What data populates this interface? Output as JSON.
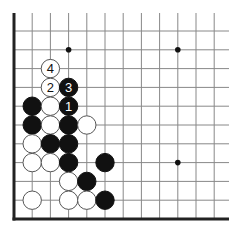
{
  "diagram": {
    "type": "go-board-corner",
    "grid": {
      "columns": 12,
      "rows": 11,
      "origin_x": 14,
      "origin_y": 31,
      "spacing_x": 18.2,
      "spacing_y": 18.8,
      "top_extent_y": 13,
      "right_extent_x": 229,
      "edges": [
        "left",
        "bottom"
      ]
    },
    "colors": {
      "line": "#888888",
      "edge": "#222222",
      "black_stone": "#111111",
      "white_stone": "#ffffff",
      "white_outline": "#555555"
    },
    "star_points": [
      {
        "col": 3,
        "row": 1
      },
      {
        "col": 9,
        "row": 1
      },
      {
        "col": 9,
        "row": 7
      }
    ],
    "stones": [
      {
        "col": 2,
        "row": 2,
        "color": "white",
        "label": "4"
      },
      {
        "col": 2,
        "row": 3,
        "color": "white",
        "label": "2"
      },
      {
        "col": 3,
        "row": 3,
        "color": "black",
        "label": "3"
      },
      {
        "col": 1,
        "row": 4,
        "color": "black",
        "label": ""
      },
      {
        "col": 2,
        "row": 4,
        "color": "white",
        "label": ""
      },
      {
        "col": 3,
        "row": 4,
        "color": "black",
        "label": "1"
      },
      {
        "col": 1,
        "row": 5,
        "color": "black",
        "label": ""
      },
      {
        "col": 2,
        "row": 5,
        "color": "white",
        "label": ""
      },
      {
        "col": 3,
        "row": 5,
        "color": "black",
        "label": ""
      },
      {
        "col": 4,
        "row": 5,
        "color": "white",
        "label": ""
      },
      {
        "col": 1,
        "row": 6,
        "color": "white",
        "label": ""
      },
      {
        "col": 2,
        "row": 6,
        "color": "black",
        "label": ""
      },
      {
        "col": 3,
        "row": 6,
        "color": "black",
        "label": ""
      },
      {
        "col": 1,
        "row": 7,
        "color": "white",
        "label": ""
      },
      {
        "col": 2,
        "row": 7,
        "color": "white",
        "label": ""
      },
      {
        "col": 3,
        "row": 7,
        "color": "black",
        "label": ""
      },
      {
        "col": 5,
        "row": 7,
        "color": "black",
        "label": ""
      },
      {
        "col": 3,
        "row": 8,
        "color": "white",
        "label": ""
      },
      {
        "col": 4,
        "row": 8,
        "color": "black",
        "label": ""
      },
      {
        "col": 1,
        "row": 9,
        "color": "white",
        "label": ""
      },
      {
        "col": 3,
        "row": 9,
        "color": "white",
        "label": ""
      },
      {
        "col": 4,
        "row": 9,
        "color": "white",
        "label": ""
      },
      {
        "col": 5,
        "row": 9,
        "color": "black",
        "label": ""
      }
    ]
  }
}
